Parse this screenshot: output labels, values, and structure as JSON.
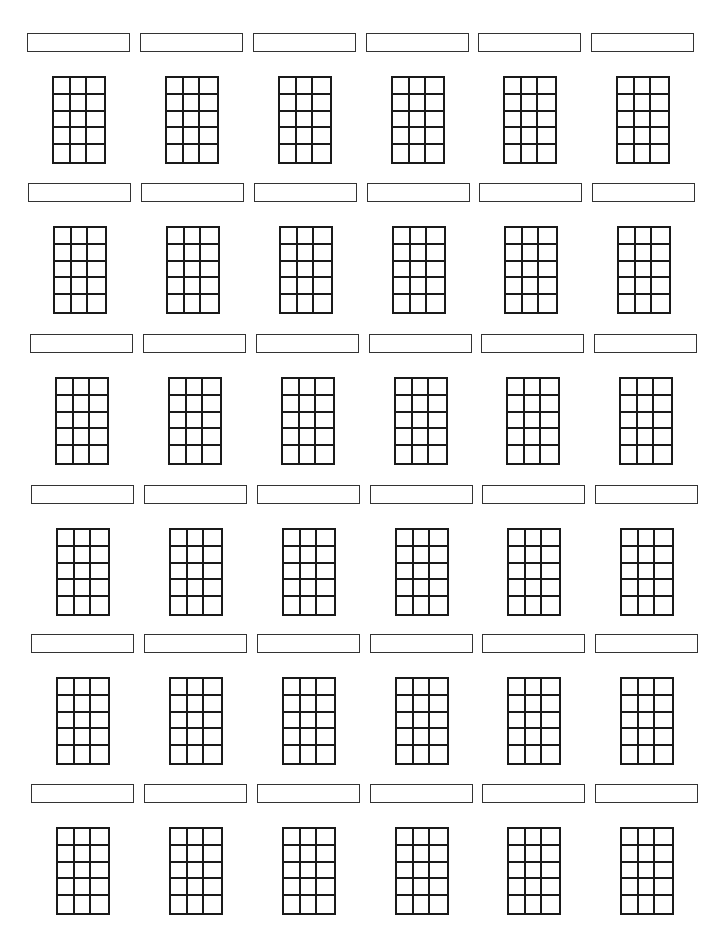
{
  "worksheet": {
    "type": "blank chord chart sheet",
    "layout": {
      "rows": 6,
      "columns": 6
    },
    "grid": {
      "strings": 4,
      "frets": 5,
      "columns_drawn": 3
    },
    "colors": {
      "line": "#1a1a1a",
      "box_border": "#333333",
      "background": "#ffffff"
    },
    "rows": [
      {
        "top": 33,
        "x_offset": 0,
        "labels": [
          "",
          "",
          "",
          "",
          "",
          ""
        ]
      },
      {
        "top": 183,
        "x_offset": 1,
        "labels": [
          "",
          "",
          "",
          "",
          "",
          ""
        ]
      },
      {
        "top": 334,
        "x_offset": 3,
        "labels": [
          "",
          "",
          "",
          "",
          "",
          ""
        ]
      },
      {
        "top": 485,
        "x_offset": 4,
        "labels": [
          "",
          "",
          "",
          "",
          "",
          ""
        ]
      },
      {
        "top": 634,
        "x_offset": 4,
        "labels": [
          "",
          "",
          "",
          "",
          "",
          ""
        ]
      },
      {
        "top": 784,
        "x_offset": 4,
        "labels": [
          "",
          "",
          "",
          "",
          "",
          ""
        ]
      }
    ],
    "column_lefts": [
      27,
      140,
      253,
      366,
      478,
      591
    ]
  }
}
